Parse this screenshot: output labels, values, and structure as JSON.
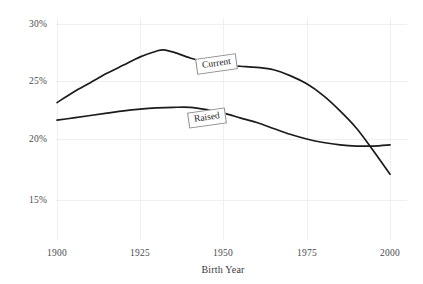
{
  "chart_data": {
    "type": "line",
    "title": "",
    "subtitle": "",
    "xlabel": "Birth Year",
    "ylabel": "",
    "xlim": [
      1900,
      2000
    ],
    "ylim": [
      14.2,
      30.5
    ],
    "grid": true,
    "legend_position": "inline-labels",
    "x_tick_labels": [
      "1900",
      "1925",
      "1950",
      "1975",
      "2000"
    ],
    "x_ticks": [
      1900,
      1925,
      1950,
      1975,
      2000
    ],
    "y_tick_labels": [
      "30%",
      "25%",
      "20%",
      "15%"
    ],
    "y_ticks": [
      30,
      25,
      20,
      15
    ],
    "y_unit": "%",
    "series": [
      {
        "name": "Current",
        "color": "#1b1b1b",
        "label_text": "Current",
        "x": [
          1900,
          1905,
          1910,
          1915,
          1920,
          1925,
          1930,
          1932,
          1935,
          1940,
          1945,
          1950,
          1955,
          1960,
          1965,
          1970,
          1975,
          1980,
          1985,
          1990,
          1995,
          2000
        ],
        "values": [
          23.3,
          24.2,
          25.0,
          25.8,
          26.5,
          27.2,
          27.7,
          27.8,
          27.6,
          27.1,
          26.7,
          26.5,
          26.4,
          26.3,
          26.1,
          25.6,
          24.9,
          23.9,
          22.6,
          21.1,
          19.2,
          17.2
        ]
      },
      {
        "name": "Raised",
        "color": "#1b1b1b",
        "label_text": "Raised",
        "x": [
          1900,
          1905,
          1910,
          1915,
          1920,
          1925,
          1930,
          1935,
          1940,
          1945,
          1950,
          1955,
          1960,
          1965,
          1970,
          1975,
          1980,
          1985,
          1990,
          1995,
          2000
        ],
        "values": [
          21.8,
          22.0,
          22.2,
          22.4,
          22.6,
          22.75,
          22.85,
          22.9,
          22.9,
          22.7,
          22.4,
          22.0,
          21.6,
          21.1,
          20.6,
          20.2,
          19.9,
          19.7,
          19.6,
          19.6,
          19.7
        ]
      }
    ],
    "annotations": [
      {
        "text": "Current",
        "series": "Current",
        "x": 1950,
        "y": 26.5
      },
      {
        "text": "Raised",
        "series": "Raised",
        "x": 1946,
        "y": 22.5
      }
    ]
  }
}
